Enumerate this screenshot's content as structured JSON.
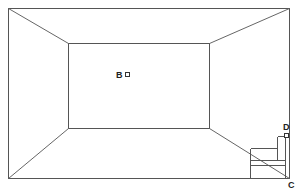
{
  "diagram": {
    "type": "one-point perspective room",
    "labels": {
      "B": "B",
      "C": "C",
      "D": "D"
    },
    "outer_rect": {
      "x1": 8,
      "y1": 8,
      "x2": 289,
      "y2": 178
    },
    "inner_rect": {
      "x1": 68,
      "y1": 43,
      "x2": 209,
      "y2": 128
    },
    "points": {
      "B": {
        "x": 127,
        "y": 74
      },
      "C": {
        "x": 289,
        "y": 178
      },
      "D": {
        "x": 286,
        "y": 135
      }
    },
    "colors": {
      "line": "#555555",
      "label": "#222222",
      "background": "#ffffff"
    }
  }
}
